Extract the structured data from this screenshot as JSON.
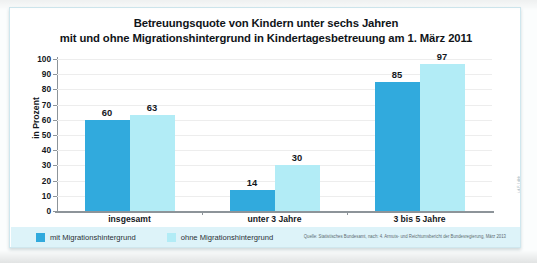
{
  "chart_data": {
    "type": "bar",
    "title": "Betreuungsquote von Kindern unter sechs Jahren mit und ohne Migrationshintergrund in Kindertagesbetreuung am 1. März 2011",
    "title_line1": "Betreuungsquote von Kindern unter sechs Jahren",
    "title_line2": "mit und ohne Migrationshintergrund in Kindertagesbetreuung am 1. März 2011",
    "xlabel": "",
    "ylabel": "in Prozent",
    "ylim": [
      0,
      100
    ],
    "ytick_step": 10,
    "yticks": [
      "0",
      "10",
      "20",
      "30",
      "40",
      "50",
      "60",
      "70",
      "80",
      "90",
      "100"
    ],
    "grid": true,
    "legend_position": "bottom-left",
    "categories": [
      "insgesamt",
      "unter 3 Jahre",
      "3 bis 5 Jahre"
    ],
    "series": [
      {
        "name": "mit Migrationshintergrund",
        "color": "#31AADD",
        "values": [
          60,
          14,
          85
        ]
      },
      {
        "name": "ohne Migrationshintergrund",
        "color": "#B2ECF6",
        "values": [
          63,
          30,
          97
        ]
      }
    ],
    "source": "Quelle: Statistisches Bundesamt, nach: 4. Armuts- und Reichtumsbericht der Bundesregierung, März 2013",
    "credit": "i.d.F. / dbb"
  },
  "colors": {
    "series_mit": "#31AADD",
    "series_ohne": "#B2ECF6",
    "legend_background": "#ddf3f9",
    "axis": "#8d9499",
    "gridline": "#ededed",
    "text": "#14181c",
    "card_border": "#cfe7ee"
  }
}
